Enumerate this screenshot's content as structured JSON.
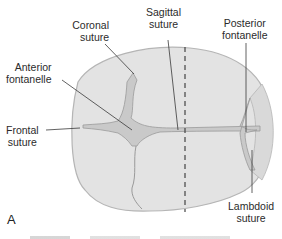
{
  "figure": {
    "panel_letter": "A",
    "colors": {
      "skull_fill": "#e3e3e3",
      "skull_edge": "#b5b5b5",
      "fontanelle_fill": "#c9c9c9",
      "suture_line": "#9a9a9a",
      "leader_line": "#3a3a3a",
      "text": "#2b2b2b"
    },
    "labels": {
      "coronal_suture": [
        "Coronal",
        "suture"
      ],
      "sagittal_suture": [
        "Sagittal",
        "suture"
      ],
      "posterior_fontanelle": [
        "Posterior",
        "fontanelle"
      ],
      "anterior_fontanelle": [
        "Anterior",
        "fontanelle"
      ],
      "frontal_suture": [
        "Frontal",
        "suture"
      ],
      "lambdoid_suture": [
        "Lambdoid",
        "suture"
      ]
    }
  }
}
